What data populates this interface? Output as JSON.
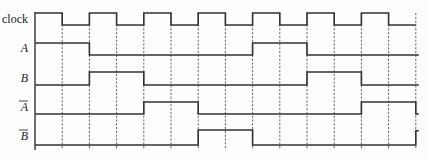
{
  "diagram": {
    "type": "timing-diagram",
    "edge_count": 15,
    "signals": [
      {
        "id": "clock",
        "label": "clock",
        "italic": false,
        "overline": false,
        "levels": [
          1,
          0,
          1,
          0,
          1,
          0,
          1,
          0,
          1,
          0,
          1,
          0,
          1,
          0
        ],
        "end_tick": "rise"
      },
      {
        "id": "A",
        "label": "A",
        "italic": true,
        "overline": false,
        "levels": [
          1,
          1,
          0,
          0,
          0,
          0,
          0,
          0,
          1,
          1,
          0,
          0,
          0,
          0
        ],
        "end_tick": "none"
      },
      {
        "id": "B",
        "label": "B",
        "italic": true,
        "overline": false,
        "levels": [
          0,
          0,
          1,
          1,
          0,
          0,
          0,
          0,
          0,
          0,
          1,
          1,
          0,
          0
        ],
        "end_tick": "none"
      },
      {
        "id": "A_bar",
        "label": "A",
        "italic": true,
        "overline": true,
        "levels": [
          0,
          0,
          0,
          0,
          1,
          1,
          0,
          0,
          0,
          0,
          0,
          0,
          1,
          1
        ],
        "end_tick": "fall"
      },
      {
        "id": "B_bar",
        "label": "B",
        "italic": true,
        "overline": true,
        "levels": [
          0,
          0,
          0,
          0,
          0,
          0,
          1,
          1,
          0,
          0,
          0,
          0,
          0,
          0
        ],
        "end_tick": "rise"
      }
    ]
  }
}
